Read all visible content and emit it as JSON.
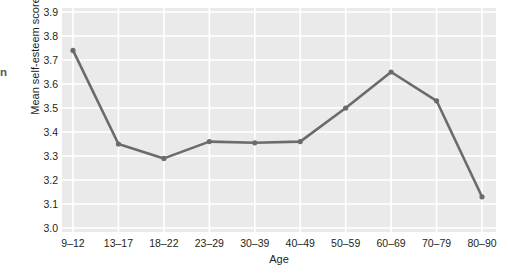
{
  "margin_fragment": "n",
  "chart_data": {
    "type": "line",
    "title": "",
    "xlabel": "Age",
    "ylabel": "Mean self-esteem score",
    "categories": [
      "9–12",
      "13–17",
      "18–22",
      "23–29",
      "30–39",
      "40–49",
      "50–59",
      "60–69",
      "70–79",
      "80–90"
    ],
    "values": [
      3.74,
      3.35,
      3.29,
      3.36,
      3.355,
      3.36,
      3.5,
      3.65,
      3.53,
      3.13
    ],
    "ylim": [
      3.0,
      3.9
    ],
    "ytick_labels": [
      "3.9",
      "3.8",
      "3.7",
      "3.6",
      "3.5",
      "3.4",
      "3.3",
      "3.2",
      "3.1",
      "3.0"
    ],
    "ytick_values": [
      3.9,
      3.8,
      3.7,
      3.6,
      3.5,
      3.4,
      3.3,
      3.2,
      3.1,
      3.0
    ],
    "grid": true,
    "legend": "none",
    "series_color": "#6b6b6b",
    "plot_background": "#eaeaea",
    "gridline_color": "#ffffff",
    "marker": "circle"
  }
}
